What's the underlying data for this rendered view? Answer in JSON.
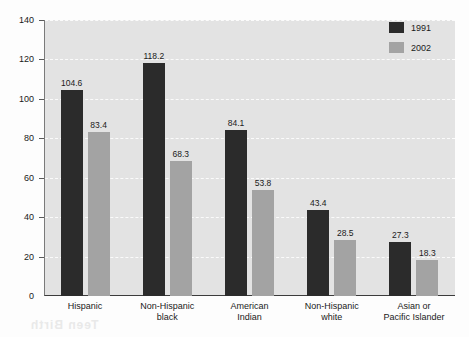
{
  "chart_data": {
    "type": "bar",
    "title": "",
    "subtitle": "",
    "xlabel": "",
    "ylabel": "",
    "ylim": [
      0,
      140
    ],
    "ytick_step": 20,
    "yticks": [
      "0",
      "20",
      "40",
      "60",
      "80",
      "100",
      "120",
      "140"
    ],
    "grid": true,
    "grid_style": "dashed-white-horizontal",
    "legend_position": "top-right",
    "categories": [
      [
        "Hispanic"
      ],
      [
        "Non-Hispanic",
        "black"
      ],
      [
        "American",
        "Indian"
      ],
      [
        "Non-Hispanic",
        "white"
      ],
      [
        "Asian or",
        "Pacific Islander"
      ]
    ],
    "series": [
      {
        "name": "1991",
        "color": "#2b2b2b",
        "values": [
          104.6,
          118.2,
          84.1,
          43.4,
          27.3
        ],
        "labels": [
          "104.6",
          "118.2",
          "84.1",
          "43.4",
          "27.3"
        ]
      },
      {
        "name": "2002",
        "color": "#a3a3a3",
        "values": [
          83.4,
          68.3,
          53.8,
          28.5,
          18.3
        ],
        "labels": [
          "83.4",
          "68.3",
          "53.8",
          "28.5",
          "18.3"
        ]
      }
    ]
  },
  "legend": {
    "items": [
      {
        "label": "1991",
        "swatch": "series-0"
      },
      {
        "label": "2002",
        "swatch": "series-1"
      }
    ]
  },
  "artifacts": {
    "bleed_top": "Adolescent Births",
    "bleed_bottom": "Teen Birth"
  },
  "colors": {
    "plot_background": "#e3e3e3",
    "page_background": "#fdfdfd",
    "series_1991": "#2b2b2b",
    "series_2002": "#a3a3a3",
    "gridline": "#fbfbfb",
    "axis": "#3c3c3c",
    "text": "#1a1a1a"
  }
}
